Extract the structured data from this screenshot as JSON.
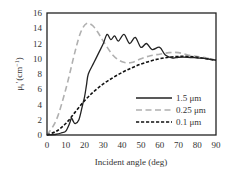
{
  "chart_data": {
    "type": "line",
    "title": "",
    "xlabel": "Incident angle (deg)",
    "ylabel": "μs′ (cm⁻¹)",
    "ylabel_parts": {
      "mu": "μ",
      "sub": "s",
      "prime": "′",
      "unit": "(cm",
      "exp": "−1",
      "close": ")"
    },
    "xlim": [
      0,
      90
    ],
    "ylim": [
      0,
      16
    ],
    "xticks": [
      0,
      10,
      20,
      30,
      40,
      50,
      60,
      70,
      80,
      90
    ],
    "yticks": [
      0,
      2,
      4,
      6,
      8,
      10,
      12,
      14,
      16
    ],
    "grid": false,
    "legend_position": "lower right (inside)",
    "series": [
      {
        "name": "1.5 μm",
        "style": "solid",
        "color": "#222222",
        "x": [
          0,
          5,
          8,
          10,
          12,
          13,
          14,
          15,
          17,
          19,
          20,
          21,
          22,
          25,
          28,
          30,
          32,
          34,
          36,
          38,
          41,
          44,
          47,
          50,
          53,
          56,
          60,
          63,
          67,
          70,
          75,
          80,
          85,
          90
        ],
        "y": [
          0,
          0.1,
          0.3,
          0.5,
          1.5,
          2.2,
          1.8,
          1.5,
          2.0,
          4.0,
          5.0,
          6.5,
          8.0,
          9.5,
          11.0,
          12.0,
          13.2,
          12.5,
          13.0,
          12.3,
          13.2,
          12.0,
          12.8,
          11.5,
          12.0,
          11.2,
          11.5,
          10.5,
          10.1,
          10.2,
          10.2,
          10.1,
          10.0,
          9.8
        ]
      },
      {
        "name": "0.25 μm",
        "style": "long-dash",
        "color": "#b0b0b0",
        "x": [
          0,
          5,
          10,
          15,
          18,
          21,
          24,
          27,
          30,
          35,
          40,
          45,
          50,
          55,
          60,
          65,
          70,
          75,
          80,
          85,
          90
        ],
        "y": [
          0,
          2.0,
          6.0,
          11.0,
          13.5,
          14.6,
          14.4,
          13.5,
          12.3,
          10.5,
          9.6,
          9.5,
          10.0,
          10.4,
          10.6,
          10.8,
          10.8,
          10.5,
          10.3,
          10.1,
          9.8
        ]
      },
      {
        "name": "0.1 μm",
        "style": "short-dash",
        "color": "#111111",
        "x": [
          0,
          5,
          10,
          15,
          20,
          25,
          30,
          35,
          40,
          45,
          50,
          55,
          60,
          65,
          70,
          75,
          80,
          85,
          90
        ],
        "y": [
          0,
          0.5,
          1.5,
          3.0,
          4.5,
          5.7,
          6.7,
          7.5,
          8.2,
          8.8,
          9.3,
          9.7,
          10.0,
          10.2,
          10.3,
          10.3,
          10.2,
          10.0,
          9.8
        ]
      }
    ]
  }
}
